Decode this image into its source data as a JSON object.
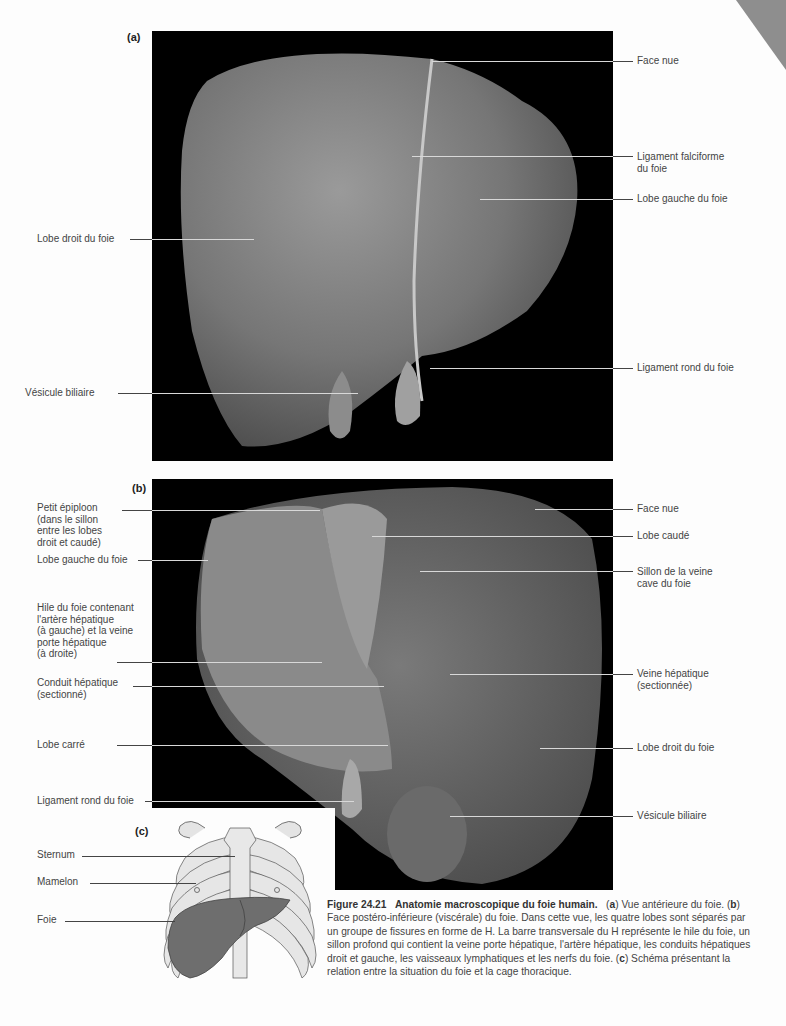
{
  "figure": {
    "number": "Figure 24.21",
    "title": "Anatomie macroscopique du foie humain.",
    "caption_parts": {
      "a_letter": "a",
      "a_text": " Vue antérieure du foie. (",
      "b_letter": "b",
      "b_text": " Face postéro-inférieure (viscérale) du foie. Dans cette vue, les quatre lobes sont séparés par un groupe de fissures en forme de H. La barre transversale du H représente le hile du foie, un sillon profond qui contient la veine porte hépatique, l'artère hépatique, les conduits hépatiques droit et gauche, les vaisseaux lymphatiques et les nerfs du foie. (",
      "c_letter": "c",
      "c_text": " Schéma présentant la relation entre la situation du foie et la cage thoracique."
    }
  },
  "panel_a": {
    "letter": "(a)",
    "labels": [
      {
        "text": "Face nue",
        "side": "right"
      },
      {
        "text": "Ligament falciforme\ndu foie",
        "side": "right"
      },
      {
        "text": "Lobe gauche du foie",
        "side": "right"
      },
      {
        "text": "Lobe droit du foie",
        "side": "left"
      },
      {
        "text": "Ligament rond du foie",
        "side": "right"
      },
      {
        "text": "Vésicule biliaire",
        "side": "left"
      }
    ]
  },
  "panel_b": {
    "letter": "(b)",
    "labels": [
      {
        "text": "Petit épiploon\n(dans le sillon\nentre les lobes\ndroit et caudé)",
        "side": "left"
      },
      {
        "text": "Lobe gauche du foie",
        "side": "left"
      },
      {
        "text": "Hile du foie contenant\nl'artère hépatique\n(à gauche) et la veine\nporte hépatique\n(à droite)",
        "side": "left"
      },
      {
        "text": "Conduit hépatique\n(sectionné)",
        "side": "left"
      },
      {
        "text": "Lobe carré",
        "side": "left"
      },
      {
        "text": "Ligament rond du foie",
        "side": "left"
      },
      {
        "text": "Face nue",
        "side": "right"
      },
      {
        "text": "Lobe caudé",
        "side": "right"
      },
      {
        "text": "Sillon de la veine\ncave du foie",
        "side": "right"
      },
      {
        "text": "Veine hépatique\n(sectionnée)",
        "side": "right"
      },
      {
        "text": "Lobe droit du foie",
        "side": "right"
      },
      {
        "text": "Vésicule biliaire",
        "side": "right"
      }
    ]
  },
  "panel_c": {
    "letter": "(c)",
    "labels": [
      {
        "text": "Sternum"
      },
      {
        "text": "Mamelon"
      },
      {
        "text": "Foie"
      }
    ]
  },
  "colors": {
    "photo_bg": "#000000",
    "liver_light": "#8a8a8a",
    "liver_dark": "#5a5a5a",
    "bone": "#e4e4e4",
    "diagram_liver": "#6e6e6e"
  }
}
